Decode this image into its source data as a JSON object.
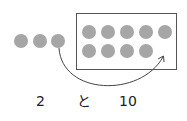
{
  "diagram": {
    "loose_dots": 3,
    "frame_dots_row1": 5,
    "frame_dots_row2": 4,
    "dot_color": "#a6a6a6",
    "frame_color": "#555555",
    "arrow": "from third loose dot into empty tenth slot of the frame"
  },
  "labels": {
    "left": "2",
    "middle": "と",
    "right": "10"
  }
}
